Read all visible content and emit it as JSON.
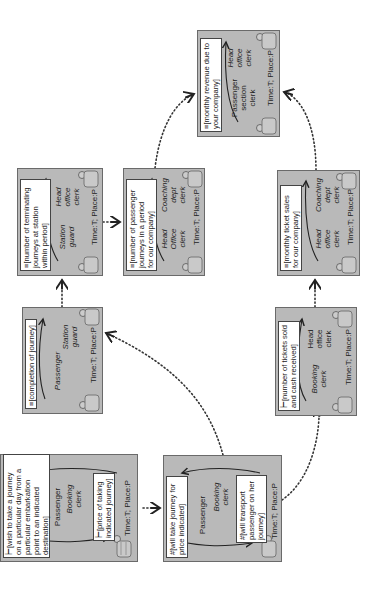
{
  "diagram": {
    "type": "interaction flow of ticket sale and revenue accounting",
    "orientation": "rotated 90 degrees counter-clockwise",
    "colors": {
      "box_fill": "#b9b9b9",
      "box_border": "#6a6a6a",
      "note_fill": "#ffffff",
      "arrow": "#222222"
    },
    "time_label": "Time:T; Place:P",
    "boxes": [
      {
        "id": "wish",
        "note": "⊢[wish to take a journey\non a particular day from a\nparticular embarkation\npoint  to an indicated\ndestination]",
        "reply_note": "⊢[price of taking\nindicated journey]",
        "left_role": "Passenger",
        "right_role": "Booking\nclerk",
        "time": "Time:T; Place:P"
      },
      {
        "id": "will-take",
        "note": "#[will take journey for\nprice indicated]",
        "reply_note": "#[will transport\npassenger on her\njourney]",
        "left_role": "Passenger",
        "right_role": "Booking\nclerk",
        "time": "Time:T; Place:P"
      },
      {
        "id": "completion",
        "note": "≡[completion of journey]",
        "left_role": "Passenger",
        "right_role": "Station\nguard",
        "time": "Time:T; Place:P"
      },
      {
        "id": "tickets-sold",
        "note": "⊢[number of tickets sold\nand cash received]",
        "left_role": "Booking\nclerk",
        "right_role": "Head\noffice\nclerk",
        "time": "Time:T; Place:P"
      },
      {
        "id": "terminating",
        "note": "≡[number of terminating\njourneys at station\nwithin period]",
        "left_role": "Station\nguard",
        "right_role": "Head\noffice\nclerk",
        "time": "Time:T; Place:P"
      },
      {
        "id": "passenger-journeys",
        "note": "≡[number of passenger\njourneys in a period\nfor our company]",
        "left_role": "Head\nOffice\nclerk",
        "right_role": "Coaching\ndept\nclerk",
        "time": "Time:T; Place:P"
      },
      {
        "id": "monthly-sales",
        "note": "≡[monthly ticket sales\nfor our company]",
        "left_role": "Head\noffice\nclerk",
        "right_role": "Coaching\ndept\nclerk",
        "time": "Time:T; Place:P"
      },
      {
        "id": "revenue",
        "note": "≡[monthly revenue due to\nyour company]",
        "left_role": "Passenger\nsection\nclerk",
        "right_role": "Head\noffice\nclerk",
        "time": "Time:T; Place:P"
      }
    ],
    "flows": [
      {
        "from": "wish",
        "to": "will-take"
      },
      {
        "from": "will-take",
        "to": "completion"
      },
      {
        "from": "will-take",
        "to": "tickets-sold"
      },
      {
        "from": "completion",
        "to": "terminating"
      },
      {
        "from": "terminating",
        "to": "passenger-journeys"
      },
      {
        "from": "passenger-journeys",
        "to": "revenue"
      },
      {
        "from": "tickets-sold",
        "to": "monthly-sales"
      },
      {
        "from": "monthly-sales",
        "to": "revenue"
      }
    ]
  }
}
